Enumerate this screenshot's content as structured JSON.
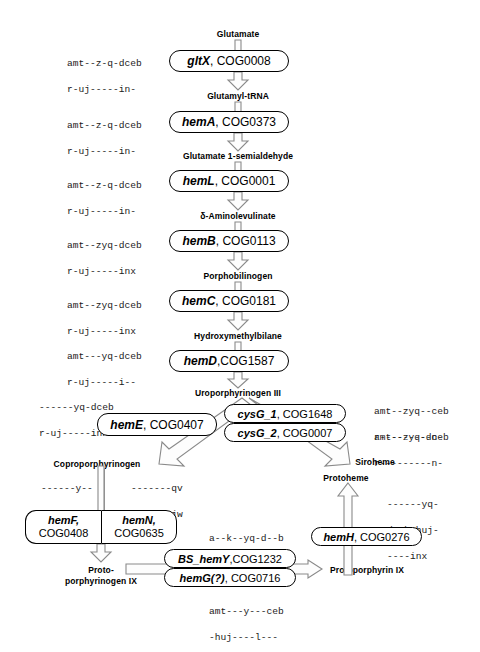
{
  "diagram": {
    "metabolites": {
      "glutamate": "Glutamate",
      "glutamyl_trna": "Glutamyl-tRNA",
      "glutamate_1_semialdehyde": "Glutamate 1-semialdehyde",
      "aminolevulinate": "δ-Aminolevulinate",
      "porphobilinogen": "Porphobilinogen",
      "hydroxymethylbilane": "Hydroxymethylbilane",
      "uroporphyrinogen_iii": "Uroporphyrinogen III",
      "coproporphyrinogen": "Coproporphyrinogen",
      "siroheme": "Siroheme",
      "protoheme": "Protoheme",
      "protoporphyrinogen_ix_line1": "Proto-",
      "protoporphyrinogen_ix_line2": "porphyrinogen IX",
      "protoporphyrin_ix": "Protoporphyrin IX"
    },
    "enzymes": {
      "gltx": {
        "gene": "gltX",
        "cog": ", COG0008"
      },
      "hema": {
        "gene": "hemA",
        "cog": ", COG0373"
      },
      "heml": {
        "gene": "hemL",
        "cog": ", COG0001"
      },
      "hemb": {
        "gene": "hemB",
        "cog": ", COG0113"
      },
      "hemc": {
        "gene": "hemC",
        "cog": ", COG0181"
      },
      "hemd": {
        "gene": "hemD",
        "cog": ",COG1587"
      },
      "heme": {
        "gene": "hemE",
        "cog": ", COG0407"
      },
      "cysg1": {
        "gene": "cysG_1",
        "cog": ", COG1648"
      },
      "cysg2": {
        "gene": "cysG_2",
        "cog": ", COG0007"
      },
      "hemf": {
        "gene": "hemF,",
        "cog": "COG0408"
      },
      "hemn": {
        "gene": "hemN,",
        "cog": "COG0635"
      },
      "bs_hemy": {
        "gene": "BS_hemY",
        "cog": ",COG1232"
      },
      "hemg": {
        "gene": "hemG(?)",
        "cog": ", COG0716"
      },
      "hemh": {
        "gene": "hemH",
        "cog": ", COG0276"
      }
    },
    "patterns": {
      "gltx": [
        "amt--z-q-dceb",
        "r-uj-----in-"
      ],
      "hema": [
        "amt--z-q-dceb",
        "r-uj-----in-"
      ],
      "heml": [
        "amt--z-q-dceb",
        "r-uj-----in-"
      ],
      "hemb": [
        "amt--zyq-dceb",
        "r-uj-----inx"
      ],
      "hemc": [
        "amt--zyq-dceb",
        "r-uj-----inx"
      ],
      "hemd": [
        "amt---yq-dceb",
        "r-uj-----i--"
      ],
      "heme": [
        "------yq-dceb",
        "r-uj-----inx"
      ],
      "cysg1": [
        "amt--zyq--ceb",
        "r---------n-"
      ],
      "cysg2": [
        "amt--zyq-dceb",
        "r---------n-"
      ],
      "hemf": [
        "------y--",
        "--ce-----",
        "-------x"
      ],
      "hemn": [
        "-------qv",
        "dcebrhujw",
        "--olinx"
      ],
      "bs_hemy": [
        "a--k--yq-d--b",
        "r--------i--"
      ],
      "hemg": [
        "amt---y---ceb",
        "-huj----l---"
      ],
      "hemh": [
        "------yq-",
        "dcebrhuj-",
        "----inx"
      ]
    }
  }
}
